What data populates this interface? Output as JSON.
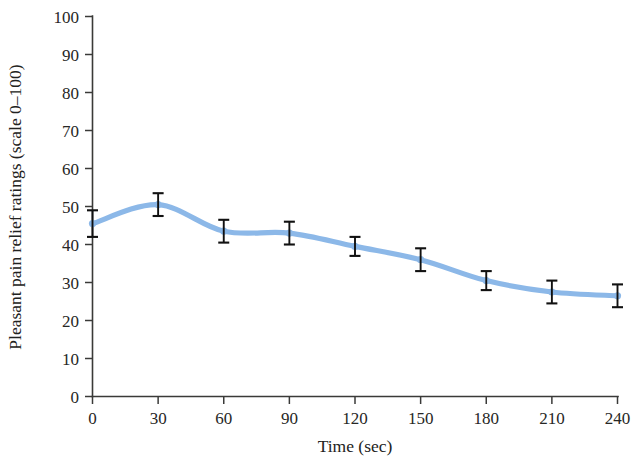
{
  "chart_data": {
    "type": "line",
    "title": "",
    "subtitle": "",
    "xlabel": "Time (sec)",
    "ylabel": "Pleasant pain relief ratings (scale 0–100)",
    "x": [
      0,
      30,
      60,
      90,
      120,
      150,
      180,
      210,
      240
    ],
    "xtick_labels": [
      "0",
      "30",
      "60",
      "90",
      "120",
      "150",
      "180",
      "210",
      "240"
    ],
    "ytick_labels": [
      "0",
      "10",
      "20",
      "30",
      "40",
      "50",
      "60",
      "70",
      "80",
      "90",
      "100"
    ],
    "ytick_values": [
      0,
      10,
      20,
      30,
      40,
      50,
      60,
      70,
      80,
      90,
      100
    ],
    "xlim": [
      0,
      240
    ],
    "ylim": [
      0,
      100
    ],
    "grid": false,
    "legend": null,
    "legend_position": "none",
    "smoothing": "spline",
    "series": [
      {
        "name": "Pleasant pain relief ratings",
        "color": "#8cb8e8",
        "values": [
          45.5,
          50.5,
          43.5,
          43.0,
          39.5,
          36.0,
          30.5,
          27.5,
          26.5
        ],
        "errors": [
          3.5,
          3.0,
          3.0,
          3.0,
          2.5,
          3.0,
          2.5,
          3.0,
          3.0
        ],
        "error_bar_color": "#111111"
      }
    ],
    "colors": {
      "line": "#8cb8e8",
      "axis": "#3a3a38",
      "text": "#222220",
      "error_bar": "#111111",
      "background": "#ffffff"
    }
  }
}
